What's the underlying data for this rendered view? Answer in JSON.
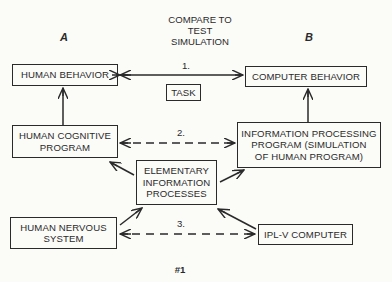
{
  "diagram": {
    "header": [
      "COMPARE TO",
      "TEST",
      "SIMULATION"
    ],
    "column_a": "A",
    "column_b": "B",
    "nodes": {
      "human_behavior": "HUMAN BEHAVIOR",
      "computer_behavior": "COMPUTER BEHAVIOR",
      "task": "TASK",
      "human_cognitive_program": [
        "HUMAN COGNITIVE",
        "PROGRAM"
      ],
      "information_processing_program": [
        "INFORMATION PROCESSING",
        "PROGRAM (SIMULATION",
        "OF HUMAN PROGRAM)"
      ],
      "elementary_information_processes": [
        "ELEMENTARY",
        "INFORMATION",
        "PROCESSES"
      ],
      "human_nervous_system": [
        "HUMAN NERVOUS",
        "SYSTEM"
      ],
      "iplv_computer": "IPL-V COMPUTER"
    },
    "edge_labels": {
      "one": "1.",
      "two": "2.",
      "three": "3."
    },
    "figure_number": "#1",
    "edges": [
      {
        "from": "human_behavior",
        "to": "computer_behavior",
        "style": "solid",
        "direction": "both",
        "label": "1."
      },
      {
        "from": "human_cognitive_program",
        "to": "human_behavior",
        "style": "solid",
        "direction": "forward"
      },
      {
        "from": "information_processing_program",
        "to": "computer_behavior",
        "style": "solid",
        "direction": "forward"
      },
      {
        "from": "human_cognitive_program",
        "to": "information_processing_program",
        "style": "dashed",
        "direction": "both",
        "label": "2."
      },
      {
        "from": "elementary_information_processes",
        "to": "human_cognitive_program",
        "style": "solid",
        "direction": "forward"
      },
      {
        "from": "elementary_information_processes",
        "to": "information_processing_program",
        "style": "solid",
        "direction": "forward"
      },
      {
        "from": "human_nervous_system",
        "to": "elementary_information_processes",
        "style": "solid",
        "direction": "forward"
      },
      {
        "from": "iplv_computer",
        "to": "elementary_information_processes",
        "style": "solid",
        "direction": "forward"
      },
      {
        "from": "human_nervous_system",
        "to": "iplv_computer",
        "style": "dashed",
        "direction": "both",
        "label": "3."
      }
    ],
    "colors": {
      "ink": "#2a2a2a",
      "paper": "#fbfbf8"
    }
  }
}
